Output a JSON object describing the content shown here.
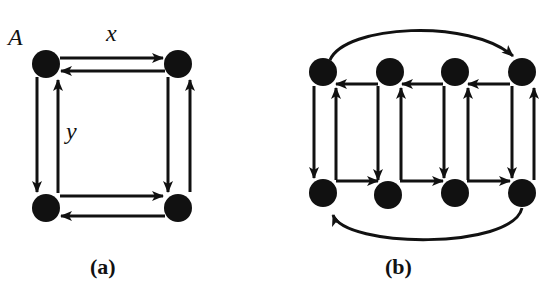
{
  "figure": {
    "panels": [
      {
        "id": "a",
        "caption": "(a)",
        "node_label": "A",
        "edge_labels": {
          "horizontal": "x",
          "vertical": "y"
        },
        "grid": "2x2 torus",
        "nodes": [
          {
            "id": "a00",
            "x": 46,
            "y": 64
          },
          {
            "id": "a01",
            "x": 178,
            "y": 64
          },
          {
            "id": "a10",
            "x": 46,
            "y": 208
          },
          {
            "id": "a11",
            "x": 178,
            "y": 208
          }
        ]
      },
      {
        "id": "b",
        "caption": "(b)",
        "grid": "2x4 with wrap-around arcs",
        "nodes_top": [
          {
            "x": 323,
            "y": 72
          },
          {
            "x": 390,
            "y": 72
          },
          {
            "x": 455,
            "y": 72
          },
          {
            "x": 522,
            "y": 72
          }
        ],
        "nodes_bottom": [
          {
            "x": 323,
            "y": 193
          },
          {
            "x": 388,
            "y": 195
          },
          {
            "x": 455,
            "y": 193
          },
          {
            "x": 522,
            "y": 193
          }
        ]
      }
    ],
    "colors": {
      "ink": "#111111",
      "background": "#ffffff"
    }
  }
}
